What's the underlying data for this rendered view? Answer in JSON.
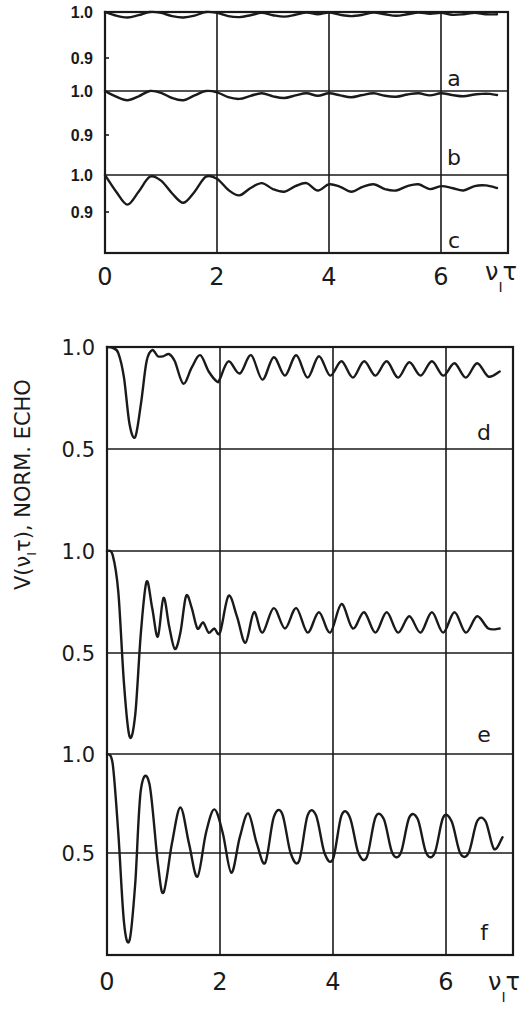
{
  "chart_data": [
    {
      "type": "line",
      "name": "top-figure",
      "title": "",
      "xlabel": "ν_I τ",
      "ylabel": "",
      "xlim": [
        0,
        7.0
      ],
      "x_ticks": [
        "0",
        "2",
        "4",
        "6"
      ],
      "x_axis_label_main": "ν",
      "x_axis_label_sub": "I",
      "x_axis_label_tail": "τ",
      "grid": true,
      "panels": [
        {
          "label": "a",
          "y_ticks": [
            "1.0",
            "0.9"
          ],
          "ylim": [
            0.875,
            1.0
          ],
          "series": [
            {
              "name": "a",
              "x": [
                0,
                0.2,
                0.4,
                0.6,
                0.8,
                1.0,
                1.2,
                1.4,
                1.6,
                1.8,
                2.0,
                2.2,
                2.4,
                2.6,
                2.8,
                3.0,
                3.2,
                3.4,
                3.6,
                3.8,
                4.0,
                4.2,
                4.4,
                4.6,
                4.8,
                5.0,
                5.2,
                5.4,
                5.6,
                5.8,
                6.0,
                6.2,
                6.4,
                6.6,
                6.8,
                7.0
              ],
              "y": [
                1.0,
                0.992,
                0.988,
                0.993,
                1.0,
                0.998,
                0.991,
                0.988,
                0.992,
                1.0,
                0.998,
                0.991,
                0.989,
                0.993,
                0.998,
                0.993,
                0.99,
                0.994,
                0.999,
                0.995,
                0.999,
                0.994,
                0.991,
                0.994,
                0.999,
                0.995,
                0.992,
                0.995,
                0.999,
                0.996,
                0.998,
                0.994,
                0.995,
                0.998,
                0.995,
                0.995
              ]
            }
          ]
        },
        {
          "label": "b",
          "y_ticks": [
            "1.0",
            "0.9"
          ],
          "ylim": [
            0.875,
            1.0
          ],
          "series": [
            {
              "name": "b",
              "x": [
                0,
                0.2,
                0.4,
                0.6,
                0.8,
                1.0,
                1.2,
                1.4,
                1.6,
                1.8,
                2.0,
                2.2,
                2.4,
                2.6,
                2.8,
                3.0,
                3.2,
                3.4,
                3.6,
                3.8,
                4.0,
                4.2,
                4.4,
                4.6,
                4.8,
                5.0,
                5.2,
                5.4,
                5.6,
                5.8,
                6.0,
                6.2,
                6.4,
                6.6,
                6.8,
                7.0
              ],
              "y": [
                1.0,
                0.987,
                0.979,
                0.988,
                1.0,
                0.996,
                0.984,
                0.979,
                0.99,
                1.0,
                0.997,
                0.986,
                0.982,
                0.989,
                0.995,
                0.988,
                0.984,
                0.99,
                0.995,
                0.989,
                0.995,
                0.99,
                0.986,
                0.991,
                0.995,
                0.989,
                0.987,
                0.992,
                0.995,
                0.99,
                0.995,
                0.991,
                0.988,
                0.992,
                0.994,
                0.991
              ]
            }
          ]
        },
        {
          "label": "c",
          "y_ticks": [
            "1.0",
            "0.9"
          ],
          "ylim": [
            0.85,
            1.0
          ],
          "series": [
            {
              "name": "c",
              "x": [
                0,
                0.2,
                0.4,
                0.6,
                0.8,
                1.0,
                1.2,
                1.4,
                1.6,
                1.8,
                2.0,
                2.2,
                2.4,
                2.6,
                2.8,
                3.0,
                3.2,
                3.4,
                3.6,
                3.8,
                4.0,
                4.2,
                4.4,
                4.6,
                4.8,
                5.0,
                5.2,
                5.4,
                5.6,
                5.8,
                6.0,
                6.2,
                6.4,
                6.6,
                6.8,
                7.0
              ],
              "y": [
                1.0,
                0.955,
                0.92,
                0.955,
                0.995,
                0.985,
                0.95,
                0.925,
                0.955,
                0.995,
                0.99,
                0.96,
                0.945,
                0.965,
                0.978,
                0.962,
                0.955,
                0.97,
                0.978,
                0.958,
                0.975,
                0.968,
                0.955,
                0.968,
                0.975,
                0.962,
                0.958,
                0.97,
                0.975,
                0.962,
                0.97,
                0.965,
                0.958,
                0.97,
                0.972,
                0.965
              ]
            }
          ]
        }
      ]
    },
    {
      "type": "line",
      "name": "bottom-figure",
      "title": "",
      "xlabel": "ν_I τ",
      "ylabel": "V(ν_I τ), NORM. ECHO",
      "ylabel_text": "V(ν",
      "ylabel_sub": "I",
      "ylabel_tail": "τ), NORM. ECHO",
      "xlim": [
        0,
        7.0
      ],
      "x_ticks": [
        "0",
        "2",
        "4",
        "6"
      ],
      "x_axis_label_main": "ν",
      "x_axis_label_sub": "I",
      "x_axis_label_tail": "τ",
      "grid": true,
      "panels": [
        {
          "label": "d",
          "y_ticks": [
            "1.0",
            "0.5"
          ],
          "ylim": [
            0.5,
            1.0
          ],
          "series": [
            {
              "name": "d",
              "x": [
                0,
                0.1,
                0.2,
                0.3,
                0.4,
                0.5,
                0.6,
                0.7,
                0.8,
                0.9,
                1.0,
                1.1,
                1.2,
                1.35,
                1.5,
                1.65,
                1.8,
                1.95,
                2.0,
                2.15,
                2.35,
                2.55,
                2.75,
                2.95,
                3.15,
                3.35,
                3.55,
                3.75,
                3.95,
                4.15,
                4.35,
                4.55,
                4.75,
                4.95,
                5.15,
                5.35,
                5.55,
                5.75,
                5.95,
                6.15,
                6.35,
                6.55,
                6.75,
                6.95
              ],
              "y": [
                1.0,
                0.995,
                0.97,
                0.85,
                0.62,
                0.56,
                0.72,
                0.93,
                0.985,
                0.955,
                0.955,
                0.965,
                0.93,
                0.82,
                0.9,
                0.96,
                0.88,
                0.83,
                0.845,
                0.93,
                0.87,
                0.96,
                0.84,
                0.95,
                0.86,
                0.96,
                0.85,
                0.955,
                0.86,
                0.93,
                0.85,
                0.93,
                0.86,
                0.93,
                0.85,
                0.925,
                0.86,
                0.93,
                0.86,
                0.92,
                0.85,
                0.92,
                0.855,
                0.88
              ]
            }
          ]
        },
        {
          "label": "e",
          "y_ticks": [
            "1.0",
            "0.5"
          ],
          "ylim": [
            0.0,
            1.0
          ],
          "series": [
            {
              "name": "e",
              "x": [
                0,
                0.1,
                0.2,
                0.3,
                0.4,
                0.5,
                0.6,
                0.7,
                0.8,
                0.9,
                1.0,
                1.1,
                1.2,
                1.3,
                1.4,
                1.5,
                1.6,
                1.7,
                1.8,
                1.9,
                2.0,
                2.15,
                2.3,
                2.45,
                2.6,
                2.75,
                2.95,
                3.15,
                3.35,
                3.55,
                3.75,
                3.95,
                4.15,
                4.35,
                4.55,
                4.75,
                4.95,
                5.15,
                5.35,
                5.55,
                5.75,
                5.95,
                6.15,
                6.35,
                6.55,
                6.75,
                6.95
              ],
              "y": [
                1.0,
                0.98,
                0.8,
                0.35,
                0.09,
                0.2,
                0.6,
                0.85,
                0.72,
                0.58,
                0.77,
                0.63,
                0.52,
                0.6,
                0.78,
                0.72,
                0.62,
                0.65,
                0.6,
                0.62,
                0.6,
                0.78,
                0.68,
                0.55,
                0.7,
                0.6,
                0.72,
                0.62,
                0.72,
                0.6,
                0.7,
                0.6,
                0.74,
                0.62,
                0.7,
                0.6,
                0.7,
                0.6,
                0.68,
                0.6,
                0.7,
                0.6,
                0.7,
                0.6,
                0.68,
                0.62,
                0.62
              ]
            }
          ]
        },
        {
          "label": "f",
          "y_ticks": [
            "1.0",
            "0.5"
          ],
          "ylim": [
            0.0,
            1.0
          ],
          "series": [
            {
              "name": "f",
              "x": [
                0,
                0.1,
                0.2,
                0.3,
                0.4,
                0.5,
                0.6,
                0.75,
                0.9,
                1.0,
                1.15,
                1.3,
                1.45,
                1.6,
                1.75,
                1.9,
                2.05,
                2.2,
                2.35,
                2.5,
                2.65,
                2.8,
                2.95,
                3.1,
                3.25,
                3.4,
                3.55,
                3.7,
                3.85,
                4.0,
                4.15,
                4.3,
                4.45,
                4.6,
                4.75,
                4.9,
                5.05,
                5.2,
                5.35,
                5.5,
                5.65,
                5.8,
                5.95,
                6.1,
                6.25,
                6.4,
                6.55,
                6.7,
                6.85,
                7.0
              ],
              "y": [
                1.0,
                0.95,
                0.6,
                0.15,
                0.06,
                0.35,
                0.82,
                0.85,
                0.45,
                0.3,
                0.55,
                0.73,
                0.55,
                0.38,
                0.6,
                0.72,
                0.6,
                0.4,
                0.58,
                0.7,
                0.55,
                0.45,
                0.68,
                0.7,
                0.5,
                0.46,
                0.69,
                0.69,
                0.5,
                0.47,
                0.69,
                0.68,
                0.5,
                0.48,
                0.68,
                0.67,
                0.5,
                0.5,
                0.68,
                0.67,
                0.5,
                0.5,
                0.68,
                0.66,
                0.5,
                0.5,
                0.66,
                0.66,
                0.52,
                0.58
              ]
            }
          ]
        }
      ]
    }
  ]
}
